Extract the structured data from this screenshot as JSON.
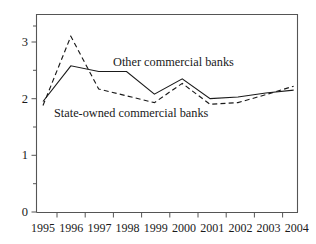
{
  "chart_data": {
    "type": "line",
    "title": "",
    "subtitle": "",
    "xlabel": "",
    "ylabel": "",
    "x": [
      1995,
      1996,
      1997,
      1998,
      1999,
      2000,
      2001,
      2002,
      2003,
      2004
    ],
    "xtick_labels": [
      "1995",
      "1996",
      "1997",
      "1998",
      "1999",
      "2000",
      "2001",
      "2002",
      "2003",
      "2004"
    ],
    "ytick_labels": [
      "0",
      "1",
      "2",
      "3"
    ],
    "ytick_values": [
      0,
      1,
      2,
      3
    ],
    "yminor_values": [
      0.5,
      1.5,
      2.5
    ],
    "ylim": [
      0,
      3.45
    ],
    "xlim": [
      1994.75,
      2005.0
    ],
    "grid": false,
    "legend_position": "inline-annotation",
    "series": [
      {
        "name": "Other commercial banks",
        "style": "solid",
        "color": "#1a1a1a",
        "values": [
          1.95,
          2.58,
          2.48,
          2.48,
          2.08,
          2.35,
          2.0,
          2.03,
          2.1,
          2.15
        ]
      },
      {
        "name": "State-owned commercial banks",
        "style": "dashed",
        "color": "#1a1a1a",
        "values": [
          1.88,
          3.1,
          2.17,
          2.05,
          1.93,
          2.27,
          1.9,
          1.93,
          2.07,
          2.22
        ]
      }
    ],
    "annotations": [
      {
        "id": "other",
        "text": "Other commercial banks"
      },
      {
        "id": "soe",
        "text": "State-owned commercial banks"
      }
    ]
  },
  "axes": {
    "y_ticks": [
      {
        "label": "3"
      },
      {
        "label": "2"
      },
      {
        "label": "1"
      },
      {
        "label": "0"
      }
    ],
    "x_ticks": [
      {
        "label": "1995"
      },
      {
        "label": "1996"
      },
      {
        "label": "1997"
      },
      {
        "label": "1998"
      },
      {
        "label": "1999"
      },
      {
        "label": "2000"
      },
      {
        "label": "2001"
      },
      {
        "label": "2002"
      },
      {
        "label": "2003"
      },
      {
        "label": "2004"
      }
    ]
  },
  "colors": {
    "axis": "#555555",
    "ink": "#1a1a1a",
    "background": "#ffffff"
  }
}
